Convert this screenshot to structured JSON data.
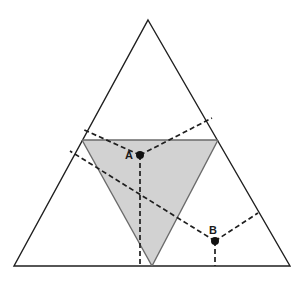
{
  "figure": {
    "background_color": "#ffffff",
    "stroke_color": "#1f1f1f",
    "shade_color": "#d2d2d2",
    "shade_stroke_color": "#6a6a6a",
    "dash_color": "#1f1f1f",
    "point_color": "#111111",
    "stroke_width": 1.4,
    "dash_pattern": "5,3",
    "outer_triangle": {
      "name": "outer-triangle",
      "apex": {
        "x": 148,
        "y": 20
      },
      "bottom_left": {
        "x": 14,
        "y": 266
      },
      "bottom_right": {
        "x": 290,
        "y": 266
      },
      "filled": false
    },
    "shaded_triangle": {
      "name": "shaded-inverted-triangle",
      "top_left": {
        "x": 82,
        "y": 140
      },
      "top_right": {
        "x": 218,
        "y": 140
      },
      "bottom": {
        "x": 152,
        "y": 266
      },
      "fill": "#d2d2d2"
    },
    "points": [
      {
        "id": "A",
        "label": "A",
        "x": 140,
        "y": 155,
        "label_dx": -11,
        "label_dy": 4,
        "radius": 4
      },
      {
        "id": "B",
        "label": "B",
        "x": 215,
        "y": 241,
        "label_dx": -2,
        "label_dy": -7,
        "radius": 4
      }
    ],
    "dashed_edges": [
      {
        "name": "edge-a-upper-left",
        "x1": 140,
        "y1": 155,
        "x2": 82,
        "y2": 129
      },
      {
        "name": "edge-a-upper-right",
        "x1": 140,
        "y1": 155,
        "x2": 212,
        "y2": 118
      },
      {
        "name": "edge-a-down",
        "x1": 140,
        "y1": 155,
        "x2": 140,
        "y2": 266
      },
      {
        "name": "edge-b-upper-left",
        "x1": 215,
        "y1": 241,
        "x2": 70,
        "y2": 151
      },
      {
        "name": "edge-b-upper-right",
        "x1": 215,
        "y1": 241,
        "x2": 258,
        "y2": 213
      },
      {
        "name": "edge-b-down",
        "x1": 215,
        "y1": 241,
        "x2": 215,
        "y2": 266
      }
    ],
    "solid_inner_edges": [
      {
        "name": "shade-top-edge",
        "x1": 82,
        "y1": 140,
        "x2": 218,
        "y2": 140
      },
      {
        "name": "shade-left-edge",
        "x1": 82,
        "y1": 140,
        "x2": 152,
        "y2": 266
      },
      {
        "name": "shade-right-edge",
        "x1": 218,
        "y1": 140,
        "x2": 152,
        "y2": 266
      }
    ]
  }
}
